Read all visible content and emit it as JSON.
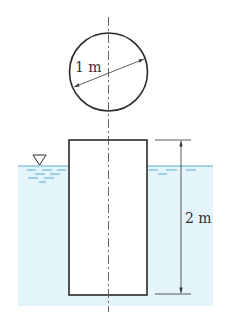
{
  "diagram": {
    "type": "floating-cylinder",
    "top_view": {
      "shape": "circle",
      "diameter_label": "1 m"
    },
    "side_view": {
      "shape": "rectangle",
      "height_label": "2 m"
    },
    "water_surface_symbol": "▽",
    "colors": {
      "water": "#e3f4fa",
      "waterline": "#5aa9d6",
      "outline": "#2a2a2a",
      "centerline": "#555555",
      "dimension": "#333333"
    }
  }
}
